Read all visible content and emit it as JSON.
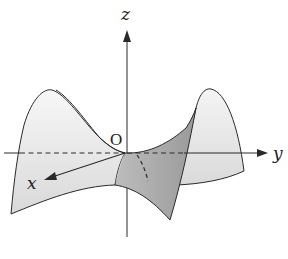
{
  "figure": {
    "labels": {
      "z_axis": "z",
      "y_axis": "y",
      "x_axis": "x",
      "origin": "O"
    },
    "colors": {
      "background": "#ffffff",
      "stroke": "#2a2a2a",
      "light_fill": "#e6e6e6",
      "lighter_fill": "#ededed",
      "dark_fill": "#a8a8a8",
      "mid_fill": "#cfcfcf"
    }
  }
}
